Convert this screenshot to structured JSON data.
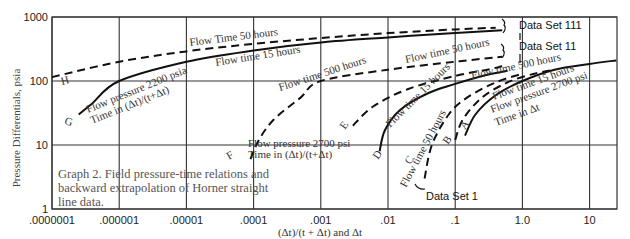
{
  "chart_data": {
    "type": "line",
    "title": "Graph 2. Field pressure-time relations and backward extrapolation of Horner straight line data.",
    "caption_lines": [
      "Graph 2. Field pressure-time relations and",
      "backward extrapolation of Horner straight",
      "line data."
    ],
    "xlabel": "(Δt)/(t + Δt) and Δt",
    "ylabel": "Pressure Differentials, psia",
    "xscale": "log",
    "yscale": "log",
    "xlim": [
      1e-07,
      30
    ],
    "ylim": [
      1,
      1000
    ],
    "grid": true,
    "x_ticks": [
      {
        "value": 1e-07,
        "label": ".0000001"
      },
      {
        "value": 1e-06,
        "label": ".000001"
      },
      {
        "value": 1e-05,
        "label": ".00001"
      },
      {
        "value": 0.0001,
        "label": ".0001"
      },
      {
        "value": 0.001,
        "label": ".001"
      },
      {
        "value": 0.01,
        "label": ".01"
      },
      {
        "value": 0.1,
        "label": ".1"
      },
      {
        "value": 1,
        "label": "1.0"
      },
      {
        "value": 10,
        "label": "10"
      }
    ],
    "y_ticks": [
      {
        "value": 1,
        "label": "1"
      },
      {
        "value": 10,
        "label": "10"
      },
      {
        "value": 100,
        "label": "100"
      },
      {
        "value": 1000,
        "label": "1000"
      }
    ],
    "series": [
      {
        "name": "H - Flow Time 50 hours (Data Set 111)",
        "label": "H",
        "style": "dashed",
        "data_set": "Data Set 111",
        "points": [
          [
            1e-07,
            115
          ],
          [
            1e-06,
            200
          ],
          [
            1e-05,
            290
          ],
          [
            0.0001,
            380
          ],
          [
            0.001,
            470
          ],
          [
            0.01,
            560
          ],
          [
            0.1,
            640
          ],
          [
            0.4,
            680
          ]
        ]
      },
      {
        "name": "G - Flow time 15 hours, Flow pressure 2200 psia, Time in (Δt)/(t+Δt) (Data Set 111)",
        "label": "G",
        "style": "solid",
        "data_set": "Data Set 111",
        "points": [
          [
            2.5e-07,
            30
          ],
          [
            4e-07,
            45
          ],
          [
            1e-06,
            100
          ],
          [
            1e-05,
            200
          ],
          [
            0.0001,
            300
          ],
          [
            0.001,
            400
          ],
          [
            0.01,
            480
          ],
          [
            0.1,
            560
          ],
          [
            0.5,
            620
          ]
        ]
      },
      {
        "name": "F - Flow time 500 hours, Flow pressure 2700 psi, Time in (Δt)/(t+Δt) (Data Set 11)",
        "label": "F",
        "style": "dashed",
        "data_set": "Data Set 11",
        "points": [
          [
            9e-05,
            6
          ],
          [
            0.00012,
            12
          ],
          [
            0.0002,
            25
          ],
          [
            0.0005,
            55
          ],
          [
            0.001,
            100
          ],
          [
            0.01,
            150
          ],
          [
            0.1,
            200
          ],
          [
            0.5,
            240
          ]
        ]
      },
      {
        "name": "E - Flow time 50 hours (Data Set 11)",
        "label": "E",
        "style": "dashed",
        "data_set": "Data Set 11",
        "points": [
          [
            0.003,
            20
          ],
          [
            0.006,
            40
          ],
          [
            0.02,
            75
          ],
          [
            0.1,
            120
          ],
          [
            0.3,
            150
          ],
          [
            0.5,
            170
          ]
        ]
      },
      {
        "name": "D - Flow time 15 hours (Data Set 11)",
        "label": "D",
        "style": "solid",
        "data_set": "Data Set 11",
        "points": [
          [
            0.0075,
            8
          ],
          [
            0.009,
            17
          ],
          [
            0.015,
            35
          ],
          [
            0.04,
            65
          ],
          [
            0.1,
            90
          ],
          [
            0.3,
            125
          ],
          [
            0.6,
            145
          ]
        ]
      },
      {
        "name": "C - Flow time 50 hours (Data Set 1)",
        "label": "C",
        "style": "dashed",
        "data_set": "Data Set 1",
        "points": [
          [
            0.035,
            3
          ],
          [
            0.045,
            10
          ],
          [
            0.08,
            30
          ],
          [
            0.15,
            55
          ],
          [
            0.4,
            95
          ],
          [
            1,
            130
          ]
        ]
      },
      {
        "name": "B - Flow time 500 hours (Data Set 1)",
        "label": "B",
        "style": "dashed",
        "data_set": "Data Set 1",
        "points": [
          [
            0.1,
            12
          ],
          [
            0.13,
            25
          ],
          [
            0.25,
            55
          ],
          [
            0.6,
            95
          ],
          [
            1.5,
            130
          ],
          [
            3,
            150
          ]
        ]
      },
      {
        "name": "A - Flow time 15 hours, Flow pressure 2700 psi, Time in Δt (Data Set 1)",
        "label": "A",
        "style": "solid",
        "data_set": "Data Set 1",
        "points": [
          [
            0.14,
            14
          ],
          [
            0.2,
            30
          ],
          [
            0.4,
            60
          ],
          [
            1,
            100
          ],
          [
            3,
            150
          ],
          [
            10,
            185
          ],
          [
            25,
            210
          ]
        ]
      }
    ],
    "annotations": [
      {
        "text": "Flow Time 50 hours",
        "near": "H"
      },
      {
        "text": "Flow time 15 hours",
        "near": "G"
      },
      {
        "text": "Flow pressure 2200 psia",
        "near": "G"
      },
      {
        "text": "Time in (Δt)/(t+Δt)",
        "near": "G"
      },
      {
        "text": "Flow time 500 hours",
        "near": "F"
      },
      {
        "text": "Flow pressure 2700 psi",
        "near": "F"
      },
      {
        "text": "Time in (Δt)/(t+Δt)",
        "near": "F"
      },
      {
        "text": "Flow time 50 hours",
        "near": "E"
      },
      {
        "text": "Flow time 15 hours",
        "near": "D"
      },
      {
        "text": "Flow time 50 hours",
        "near": "C"
      },
      {
        "text": "Flow time 500 hours",
        "near": "B"
      },
      {
        "text": "Flow time 15 hours",
        "near": "A"
      },
      {
        "text": "Flow pressure 2700 psi",
        "near": "A"
      },
      {
        "text": "Time in Δt",
        "near": "A"
      },
      {
        "text": "Data Set 111",
        "near": "top right"
      },
      {
        "text": "Data Set 11",
        "near": "right"
      },
      {
        "text": "Data Set 1",
        "near": "bottom"
      }
    ]
  },
  "axes": {
    "ylabel": "Pressure Differentials, psia",
    "xlabel": "(Δt)/(t + Δt) and Δt"
  },
  "labels": {
    "curve_h": "H",
    "curve_g": "G",
    "curve_f": "F",
    "curve_e": "E",
    "curve_d": "D",
    "curve_c": "C",
    "curve_b": "B",
    "curve_a": "A",
    "h_label": "Flow Time 50 hours",
    "g_label_1": "Flow time 15 hours",
    "g_label_2": "Flow pressure 2200 psia",
    "g_label_3": "Time in (Δt)/(t+Δt)",
    "f_label_1": "Flow time 500 hours",
    "f_label_2": "Flow pressure 2700 psi",
    "f_label_3": "Time in (Δt)/(t+Δt)",
    "e_label": "Flow time 50 hours",
    "d_label": "Flow time 15 hours",
    "c_label": "Flow time 50 hours",
    "b_label": "Flow time 500 hours",
    "a_label_1": "Flow time 15 hours",
    "a_label_2": "Flow pressure 2700 psi",
    "a_label_3": "Time in Δt",
    "data_set_111": "Data Set 111",
    "data_set_11": "Data Set 11",
    "data_set_1": "Data Set 1"
  }
}
